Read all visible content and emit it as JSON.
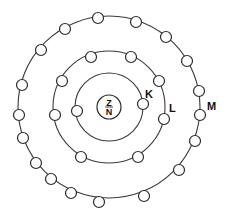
{
  "diagram": {
    "type": "atomic-shell-model",
    "nucleus": {
      "top_label": "Z",
      "bottom_label": "N",
      "center": [
        109,
        107
      ],
      "radius": 12
    },
    "shells": [
      {
        "name": "K",
        "label": "K",
        "radius": 34,
        "label_pos": [
          145,
          98
        ],
        "electron_count": 2,
        "electrons": [
          [
            77,
            111
          ],
          [
            143,
            104
          ]
        ]
      },
      {
        "name": "L",
        "label": "L",
        "radius": 56,
        "label_pos": [
          169,
          112
        ],
        "electron_count": 8,
        "electrons": [
          [
            91,
            57
          ],
          [
            131,
            57
          ],
          [
            62,
            81
          ],
          [
            159,
            81
          ],
          [
            55,
            115
          ],
          [
            164,
            119
          ],
          [
            81,
            157
          ],
          [
            138,
            157
          ]
        ]
      },
      {
        "name": "M",
        "label": "M",
        "radius": 91,
        "label_pos": [
          207,
          110
        ],
        "electron_count": 18,
        "electrons": [
          [
            98,
            18
          ],
          [
            136,
            22
          ],
          [
            65,
            29
          ],
          [
            166,
            37
          ],
          [
            41,
            50
          ],
          [
            187,
            61
          ],
          [
            22,
            85
          ],
          [
            199,
            91
          ],
          [
            19,
            115
          ],
          [
            200,
            115
          ],
          [
            23,
            138
          ],
          [
            195,
            141
          ],
          [
            36,
            163
          ],
          [
            179,
            170
          ],
          [
            51,
            179
          ],
          [
            71,
            193
          ],
          [
            99,
            202
          ],
          [
            144,
            196
          ]
        ]
      }
    ],
    "electron_radius": 5.5,
    "colors": {
      "line": "#2a2a2a",
      "background": "#ffffff"
    }
  }
}
